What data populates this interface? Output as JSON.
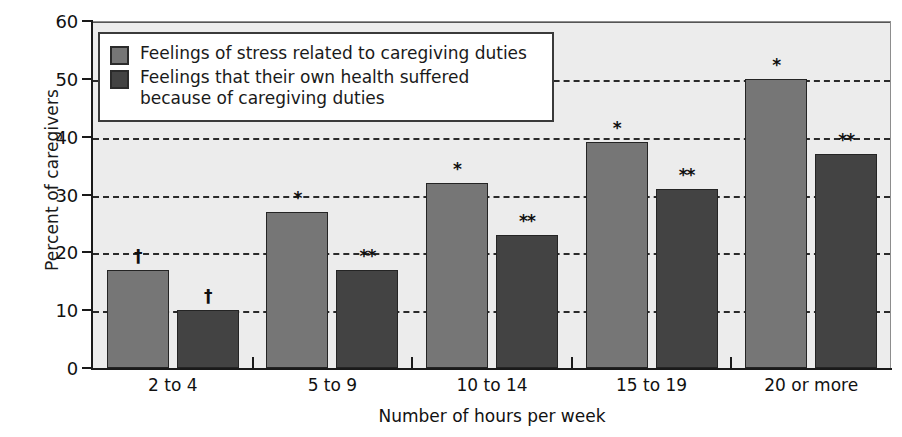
{
  "chart_data": {
    "type": "bar",
    "title": "",
    "xlabel": "Number of hours per week",
    "ylabel": "Percent of caregivers",
    "categories": [
      "2 to 4",
      "5 to 9",
      "10 to 14",
      "15 to 19",
      "20 or more"
    ],
    "ylim": [
      0,
      60
    ],
    "yticks": [
      0,
      10,
      20,
      30,
      40,
      50,
      60
    ],
    "ytick_labels": [
      "0",
      "10",
      "20",
      "30",
      "40",
      "50",
      "60"
    ],
    "grid": "horizontal-dashed",
    "legend_position": "upper-left-inside",
    "series": [
      {
        "name": "Feelings of stress related to caregiving duties",
        "color": "#767676",
        "values": [
          17,
          27,
          32,
          39,
          50
        ],
        "markers": [
          "†",
          "*",
          "*",
          "*",
          "*"
        ]
      },
      {
        "name": "Feelings that their own health suffered because of caregiving duties",
        "color": "#434343",
        "values": [
          10,
          17,
          23,
          31,
          37
        ],
        "markers": [
          "†",
          "**",
          "**",
          "**",
          "**"
        ]
      }
    ]
  },
  "legend": {
    "entries": [
      {
        "label": "Feelings of stress related to caregiving duties"
      },
      {
        "label": "Feelings that their own health suffered because of caregiving duties"
      }
    ]
  },
  "colors": {
    "series_light": "#767676",
    "series_dark": "#434343",
    "plot_background": "#ececec",
    "axis": "#1a1a1a",
    "gridline": "#2a2a2a"
  }
}
